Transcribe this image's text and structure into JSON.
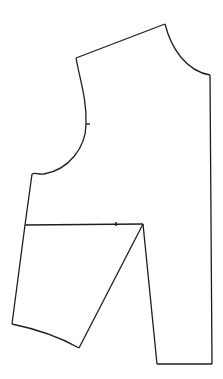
{
  "diagram": {
    "type": "sewing-pattern-piece",
    "stroke_color": "#1e1e1e",
    "background": "#ffffff",
    "points": {
      "shoulder_armhole": [
        76,
        58
      ],
      "shoulder_neck": [
        165,
        24
      ],
      "center_front_neck": [
        210,
        75
      ],
      "center_front_hem": [
        212,
        364
      ],
      "dart_right_hem": [
        157,
        364
      ],
      "dart_apex": [
        143,
        224
      ],
      "dart_left_hem": [
        79,
        348
      ],
      "side_hem": [
        12,
        324
      ],
      "side_bust_line": [
        25,
        225
      ],
      "underarm": [
        32,
        174
      ],
      "armhole_notch": [
        86,
        124
      ],
      "bust_notch": [
        116,
        224
      ]
    }
  }
}
